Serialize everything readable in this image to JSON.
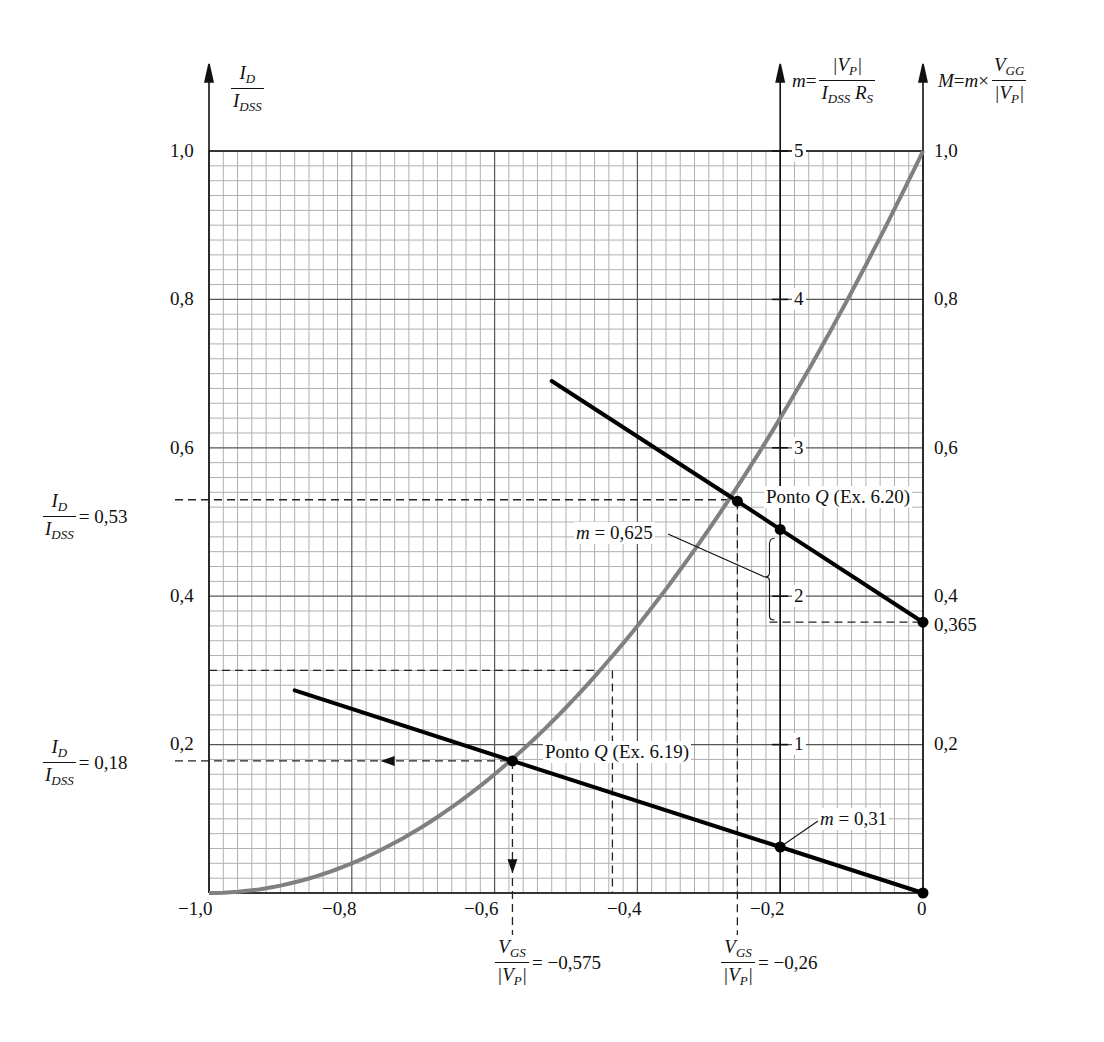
{
  "chart_data": {
    "type": "line",
    "title": "",
    "xlabel": "V_GS / |V_P|",
    "ylabel": "I_D / I_DSS",
    "xlim": [
      -1.0,
      0
    ],
    "ylim": [
      0,
      1.0
    ],
    "grid": true,
    "x_ticks": [
      "-1,0",
      "-0,8",
      "-0,6",
      "-0,4",
      "-0,2",
      "0"
    ],
    "y_ticks_left": [
      "0,2",
      "0,4",
      "0,6",
      "0,8",
      "1,0"
    ],
    "y_ticks_m": [
      "1",
      "2",
      "3",
      "4",
      "5"
    ],
    "y_ticks_M": [
      "0,2",
      "0,4",
      "0,6",
      "0,8",
      "1,0"
    ],
    "axes": {
      "left": {
        "label_num": "I",
        "label_num_sub": "D",
        "label_den": "I",
        "label_den_sub": "DSS"
      },
      "m": {
        "prefix": "m =",
        "label_num": "|V",
        "label_num_sub": "P",
        "label_num_end": "|",
        "label_den": "I",
        "label_den_sub": "DSS",
        "label_den_end": "R",
        "label_den_end_sub": "S"
      },
      "M": {
        "prefix": "M = m ×",
        "label_num": "V",
        "label_num_sub": "GG",
        "label_den": "|V",
        "label_den_sub": "P",
        "label_den_end": "|"
      }
    },
    "series": [
      {
        "name": "Universal transfer curve (I_D/I_DSS = (1 - V_GS/V_P)^2)",
        "color": "#808080",
        "x": [
          -1.0,
          -0.9,
          -0.8,
          -0.7,
          -0.6,
          -0.575,
          -0.5,
          -0.45,
          -0.4,
          -0.3,
          -0.26,
          -0.2,
          -0.1,
          0
        ],
        "y": [
          0,
          0.01,
          0.04,
          0.09,
          0.16,
          0.18,
          0.25,
          0.3,
          0.36,
          0.49,
          0.53,
          0.64,
          0.81,
          1.0
        ]
      },
      {
        "name": "Bias line Ex. 6.19 (m = 0,31)",
        "color": "#000000",
        "x": [
          -0.88,
          -0.575,
          -0.2,
          0
        ],
        "y": [
          0.273,
          0.178,
          0.062,
          0
        ]
      },
      {
        "name": "Bias line Ex. 6.20 (m = 0,625, M = 0,365)",
        "color": "#000000",
        "x": [
          -0.52,
          -0.26,
          -0.2,
          0
        ],
        "y": [
          0.69,
          0.528,
          0.49,
          0.365
        ]
      }
    ],
    "annotations": [
      {
        "text": "Ponto Q (Ex. 6.19)",
        "x": -0.575,
        "y": 0.18
      },
      {
        "text": "Ponto Q (Ex. 6.20)",
        "x": -0.26,
        "y": 0.53
      },
      {
        "text": "m = 0,625"
      },
      {
        "text": "m = 0,31"
      },
      {
        "text": "0,365"
      },
      {
        "text": "I_D/I_DSS = 0,53"
      },
      {
        "text": "I_D/I_DSS = 0,18"
      },
      {
        "text": "V_GS/|V_P| = -0,575"
      },
      {
        "text": "V_GS/|V_P| = -0,26"
      }
    ]
  },
  "labels": {
    "q_619": "Ponto Q (Ex. 6.19)",
    "q_620_pre": "Ponto ",
    "q_620_q": "Q",
    "q_620_post": " (Ex. 6.20)",
    "q_619_pre": "Ponto ",
    "q_619_q": "Q",
    "q_619_post": " (Ex. 6.19)",
    "m_0625_var": "m",
    "m_0625_val": " = 0,625",
    "m_031_var": "m",
    "m_031_val": " = 0,31",
    "M_0365": "0,365",
    "id_053_val": "= 0,53",
    "id_018_val": "= 0,18",
    "vgs_0575_val": "= −0,575",
    "vgs_026_val": "= −0,26",
    "I": "I",
    "D": "D",
    "DSS": "DSS",
    "V": "V",
    "GS": "GS",
    "P": "P",
    "GG": "GG",
    "R": "R",
    "S": "S",
    "m": "m",
    "M": "M",
    "eq": " = ",
    "times": " × ",
    "bar_open": "|",
    "bar_close": "|"
  },
  "ticks": {
    "x": [
      "−1,0",
      "−0,8",
      "−0,6",
      "−0,4",
      "−0,2",
      "0"
    ],
    "left": [
      "0,2",
      "0,4",
      "0,6",
      "0,8",
      "1,0"
    ],
    "m": [
      "1",
      "2",
      "3",
      "4",
      "5"
    ],
    "M": [
      "0,2",
      "0,4",
      "0,6",
      "0,8",
      "1,0"
    ]
  },
  "colors": {
    "curve": "#808080",
    "lines": "#000000",
    "grid_minor": "#a8a8a8",
    "grid_major": "#555555"
  }
}
